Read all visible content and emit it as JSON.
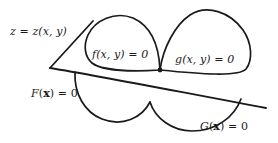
{
  "figure": {
    "background_color": "#ffffff",
    "ink_color": "#1a1a1a",
    "labels": {
      "surface": {
        "lhs": "z",
        "eq": " = ",
        "rhs": "z(x, y)",
        "text": "z = z(x, y)"
      },
      "upper_left_curve": {
        "text": "f(x, y) = 0",
        "fn": "f(x, y)",
        "eq": " = ",
        "value": "0"
      },
      "upper_right_curve": {
        "text": "g(x, y) = 0",
        "fn": "g(x, y)",
        "eq": " = ",
        "value": "0"
      },
      "lower_left_curve": {
        "text": "F(x) = 0",
        "fn": "F",
        "open": "(",
        "arg": "x",
        "close": ")",
        "eq": " = ",
        "value": "0"
      },
      "lower_right_curve": {
        "text": "G(x) = 0",
        "fn": "G",
        "open": "(",
        "arg": "x",
        "close": ")",
        "eq": " = ",
        "value": "0"
      }
    },
    "geometry": {
      "plane_vertex": [
        50,
        68
      ],
      "plane_upper_edge_end": [
        93,
        21
      ],
      "plane_lower_edge_end": [
        266,
        108
      ],
      "junction_point": [
        160,
        70
      ],
      "dome_f_apex": [
        133,
        18
      ],
      "dome_g_apex": [
        205,
        12
      ]
    }
  }
}
